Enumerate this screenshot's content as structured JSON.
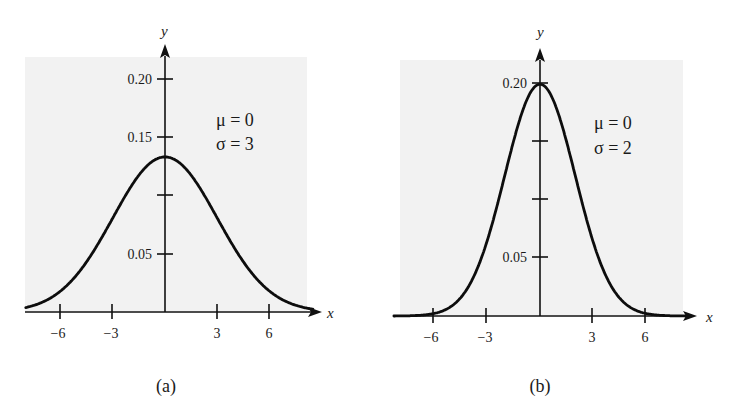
{
  "figure": {
    "panels": [
      {
        "id": "a",
        "caption": "(a)",
        "legend": {
          "mu_line": "μ = 0",
          "sigma_line": "σ = 3"
        },
        "x_axis_label": "x",
        "y_axis_label": "y",
        "x_ticks": [
          {
            "value": -6,
            "label": "−6"
          },
          {
            "value": -3,
            "label": "−3"
          },
          {
            "value": 3,
            "label": "3"
          },
          {
            "value": 6,
            "label": "6"
          }
        ],
        "y_ticks": [
          {
            "value": 0.05,
            "label": "0.05"
          },
          {
            "value": 0.1,
            "label": ""
          },
          {
            "value": 0.15,
            "label": "0.15"
          },
          {
            "value": 0.2,
            "label": "0.20"
          }
        ]
      },
      {
        "id": "b",
        "caption": "(b)",
        "legend": {
          "mu_line": "μ = 0",
          "sigma_line": "σ = 2"
        },
        "x_axis_label": "x",
        "y_axis_label": "y",
        "x_ticks": [
          {
            "value": -6,
            "label": "−6"
          },
          {
            "value": -3,
            "label": "−3"
          },
          {
            "value": 3,
            "label": "3"
          },
          {
            "value": 6,
            "label": "6"
          }
        ],
        "y_ticks": [
          {
            "value": 0.05,
            "label": "0.05"
          },
          {
            "value": 0.1,
            "label": ""
          },
          {
            "value": 0.15,
            "label": ""
          },
          {
            "value": 0.2,
            "label": "0.20"
          }
        ]
      }
    ]
  },
  "colors": {
    "background": "#ffffff",
    "shade": "#f2f2f2",
    "ink": "#111111"
  },
  "chart_data": [
    {
      "type": "line",
      "title": "(a) Normal distribution, μ = 0, σ = 3",
      "xlabel": "x",
      "ylabel": "y",
      "xlim": [
        -8,
        8.5
      ],
      "ylim": [
        0,
        0.22
      ],
      "grid": false,
      "legend_position": "upper right",
      "annotations": [
        "μ = 0",
        "σ = 3"
      ],
      "x_ticks": [
        -6,
        -3,
        3,
        6
      ],
      "y_ticks": [
        0.05,
        0.1,
        0.15,
        0.2
      ],
      "y_tick_labels": [
        "0.05",
        "",
        "0.15",
        "0.20"
      ],
      "params": {
        "mu": 0,
        "sigma": 3
      },
      "series": [
        {
          "name": "N(0, 3²)",
          "x": [
            -8,
            -6,
            -4,
            -3,
            -2,
            -1,
            0,
            1,
            2,
            3,
            4,
            6,
            8
          ],
          "values": [
            0.0038,
            0.018,
            0.0547,
            0.0807,
            0.1065,
            0.1258,
            0.133,
            0.1258,
            0.1065,
            0.0807,
            0.0547,
            0.018,
            0.0038
          ]
        }
      ]
    },
    {
      "type": "line",
      "title": "(b) Normal distribution, μ = 0, σ = 2",
      "xlabel": "x",
      "ylabel": "y",
      "xlim": [
        -8.3,
        8.5
      ],
      "ylim": [
        0,
        0.22
      ],
      "grid": false,
      "legend_position": "upper right",
      "annotations": [
        "μ = 0",
        "σ = 2"
      ],
      "x_ticks": [
        -6,
        -3,
        3,
        6
      ],
      "y_ticks": [
        0.05,
        0.1,
        0.15,
        0.2
      ],
      "y_tick_labels": [
        "0.05",
        "",
        "",
        "0.20"
      ],
      "params": {
        "mu": 0,
        "sigma": 2
      },
      "series": [
        {
          "name": "N(0, 2²)",
          "x": [
            -8,
            -6,
            -4,
            -3,
            -2,
            -1,
            0,
            1,
            2,
            3,
            4,
            6,
            8
          ],
          "values": [
            0.0001,
            0.0022,
            0.027,
            0.0648,
            0.121,
            0.176,
            0.1995,
            0.176,
            0.121,
            0.0648,
            0.027,
            0.0022,
            0.0001
          ]
        }
      ]
    }
  ]
}
